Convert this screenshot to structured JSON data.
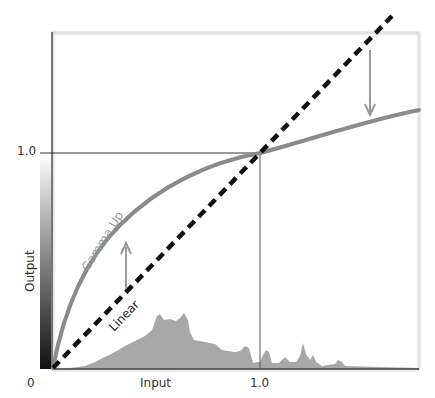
{
  "diagram": {
    "title": "",
    "x_axis": {
      "label": "Input",
      "ticks": [
        "0",
        "1.0"
      ]
    },
    "y_axis": {
      "label": "Output",
      "ticks": [
        "1.0"
      ]
    },
    "curves": [
      {
        "name": "Linear",
        "style": "dashed",
        "color": "#111111"
      },
      {
        "name": "Gamma Up",
        "style": "solid",
        "color": "#888888"
      }
    ],
    "arrows": [
      {
        "name": "raise-arrow",
        "direction": "up",
        "color": "#999999"
      },
      {
        "name": "lower-arrow",
        "direction": "down",
        "color": "#999999"
      }
    ],
    "histogram": {
      "color": "#a6a6a6"
    },
    "gradient_bar": {
      "from": "#111111",
      "to": "#ffffff"
    }
  },
  "labels": {
    "zero": "0",
    "input": "Input",
    "x_one": "1.0",
    "y_one": "1.0",
    "output": "Output",
    "gamma_up": "Gamma Up",
    "linear": "Linear"
  }
}
